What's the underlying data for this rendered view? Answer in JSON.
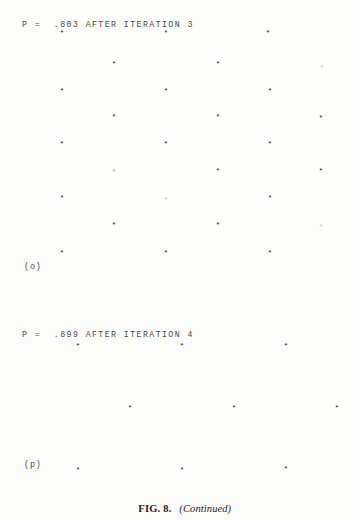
{
  "page": {
    "background_color": "#fcfcfa",
    "text_color": "#2e2e30"
  },
  "caption": {
    "figure_number": "FIG. 8.",
    "continued": "(Continued)",
    "spacer": "   "
  },
  "panels": [
    {
      "id": "o",
      "label": "(o)",
      "header": "P =  .803 AFTER ITERATION 3",
      "p_value": ".803",
      "iteration": 3,
      "marker": "*"
    },
    {
      "id": "p",
      "label": "(p)",
      "header": "P =  .899 AFTER ITERATION 4",
      "p_value": ".899",
      "iteration": 4,
      "marker": "*"
    }
  ],
  "chart_data": [
    {
      "type": "scatter",
      "title": "P =  .803 AFTER ITERATION 3",
      "panel": "(o)",
      "xlabel": "",
      "ylabel": "",
      "xlim": [
        0,
        359
      ],
      "ylim": [
        0,
        290
      ],
      "grid": false,
      "legend": false,
      "marker": "*",
      "points": [
        {
          "x": 62,
          "y": 33,
          "intensity": "normal"
        },
        {
          "x": 166,
          "y": 33,
          "intensity": "normal"
        },
        {
          "x": 268,
          "y": 33,
          "intensity": "normal"
        },
        {
          "x": 114,
          "y": 64,
          "intensity": "normal"
        },
        {
          "x": 218,
          "y": 64,
          "intensity": "normal"
        },
        {
          "x": 322,
          "y": 68,
          "intensity": "faint2"
        },
        {
          "x": 62,
          "y": 91,
          "intensity": "normal"
        },
        {
          "x": 166,
          "y": 91,
          "intensity": "normal"
        },
        {
          "x": 270,
          "y": 91,
          "intensity": "normal"
        },
        {
          "x": 114,
          "y": 117,
          "intensity": "normal"
        },
        {
          "x": 218,
          "y": 117,
          "intensity": "normal"
        },
        {
          "x": 321,
          "y": 118,
          "intensity": "normal"
        },
        {
          "x": 62,
          "y": 144,
          "intensity": "normal"
        },
        {
          "x": 166,
          "y": 144,
          "intensity": "normal"
        },
        {
          "x": 270,
          "y": 144,
          "intensity": "normal"
        },
        {
          "x": 114,
          "y": 172,
          "intensity": "faint"
        },
        {
          "x": 218,
          "y": 171,
          "intensity": "normal"
        },
        {
          "x": 321,
          "y": 171,
          "intensity": "normal"
        },
        {
          "x": 62,
          "y": 198,
          "intensity": "normal"
        },
        {
          "x": 166,
          "y": 200,
          "intensity": "faint2"
        },
        {
          "x": 270,
          "y": 198,
          "intensity": "normal"
        },
        {
          "x": 114,
          "y": 225,
          "intensity": "normal"
        },
        {
          "x": 218,
          "y": 225,
          "intensity": "normal"
        },
        {
          "x": 321,
          "y": 227,
          "intensity": "faint2"
        },
        {
          "x": 62,
          "y": 253,
          "intensity": "normal"
        },
        {
          "x": 166,
          "y": 253,
          "intensity": "normal"
        },
        {
          "x": 270,
          "y": 253,
          "intensity": "normal"
        }
      ]
    },
    {
      "type": "scatter",
      "title": "P =  .899 AFTER ITERATION 4",
      "panel": "(p)",
      "xlabel": "",
      "ylabel": "",
      "xlim": [
        0,
        359
      ],
      "ylim": [
        0,
        175
      ],
      "grid": false,
      "legend": false,
      "marker": "*",
      "points": [
        {
          "x": 78,
          "y": 34,
          "intensity": "normal"
        },
        {
          "x": 182,
          "y": 34,
          "intensity": "normal"
        },
        {
          "x": 286,
          "y": 34,
          "intensity": "normal"
        },
        {
          "x": 130,
          "y": 96,
          "intensity": "normal"
        },
        {
          "x": 234,
          "y": 96,
          "intensity": "normal"
        },
        {
          "x": 337,
          "y": 96,
          "intensity": "normal"
        },
        {
          "x": 78,
          "y": 158,
          "intensity": "normal"
        },
        {
          "x": 182,
          "y": 158,
          "intensity": "normal"
        },
        {
          "x": 286,
          "y": 157,
          "intensity": "normal"
        }
      ]
    }
  ]
}
